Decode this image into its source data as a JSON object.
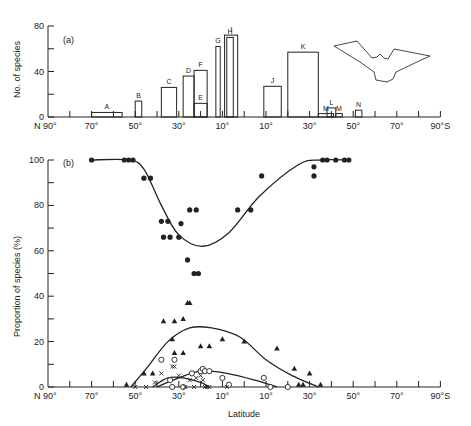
{
  "chart_data": [
    {
      "panel": "(a)",
      "type": "bar",
      "title": "",
      "xlabel": "",
      "ylabel": "No. of species",
      "ylim": [
        0,
        80
      ],
      "yticks": [
        0,
        40,
        80
      ],
      "xticks": [
        "N 90°",
        "70°",
        "50°",
        "30°",
        "10°",
        "10°",
        "30°",
        "50°",
        "70°",
        "90°S"
      ],
      "grid": false,
      "legend": null,
      "annotation": "bat silhouette (upper right)",
      "bars": [
        {
          "label": "A",
          "lat_from": "70°N",
          "lat_to": "56°N",
          "value": 4
        },
        {
          "label": "B",
          "lat_from": "50°N",
          "lat_to": "47°N",
          "value": 14
        },
        {
          "label": "C",
          "lat_from": "38°N",
          "lat_to": "31°N",
          "value": 26
        },
        {
          "label": "D",
          "lat_from": "28°N",
          "lat_to": "23°N",
          "value": 36
        },
        {
          "label": "E",
          "lat_from": "23°N",
          "lat_to": "17°N",
          "value": 12
        },
        {
          "label": "F",
          "lat_from": "23°N",
          "lat_to": "17°N",
          "value": 41
        },
        {
          "label": "G",
          "lat_from": "13°N",
          "lat_to": "11°N",
          "value": 62
        },
        {
          "label": "H",
          "lat_from": "8°N",
          "lat_to": "5°N",
          "value": 70
        },
        {
          "label": "I",
          "lat_from": "9°N",
          "lat_to": "3°N",
          "value": 72
        },
        {
          "label": "J",
          "lat_from": "9°S",
          "lat_to": "17°S",
          "value": 27
        },
        {
          "label": "K",
          "lat_from": "20°S",
          "lat_to": "34°S",
          "value": 57
        },
        {
          "label": "M",
          "lat_from": "34°S",
          "lat_to": "41°S",
          "value": 3
        },
        {
          "label": "L",
          "lat_from": "38°S",
          "lat_to": "42°S",
          "value": 8
        },
        {
          "label": "M",
          "lat_from": "42°S",
          "lat_to": "45°S",
          "value": 3
        },
        {
          "label": "N",
          "lat_from": "51°S",
          "lat_to": "54°S",
          "value": 6
        }
      ]
    },
    {
      "panel": "(b)",
      "type": "scatter",
      "title": "",
      "xlabel": "Latitude",
      "ylabel": "Proportion of species (%)",
      "ylim": [
        0,
        100
      ],
      "yticks": [
        0,
        20,
        40,
        60,
        80,
        100
      ],
      "xticks": [
        "N 90°",
        "70°",
        "50°",
        "30°",
        "10°",
        "10°",
        "30°",
        "50°",
        "70°",
        "90°S"
      ],
      "grid": false,
      "legend": null,
      "x_encoding": "position from N90 (0) to S90 (180); south latitudes = 90 + lat",
      "series": [
        {
          "name": "filled circles",
          "marker": "●",
          "points": [
            [
              20,
              100
            ],
            [
              35,
              100
            ],
            [
              37,
              100
            ],
            [
              39,
              100
            ],
            [
              44,
              92
            ],
            [
              47,
              92
            ],
            [
              52,
              73
            ],
            [
              53,
              66
            ],
            [
              55,
              73
            ],
            [
              56,
              66
            ],
            [
              60,
              66
            ],
            [
              61,
              72
            ],
            [
              64,
              56
            ],
            [
              65,
              78
            ],
            [
              67,
              50
            ],
            [
              68,
              78
            ],
            [
              69,
              50
            ],
            [
              87,
              78
            ],
            [
              93,
              78
            ],
            [
              98,
              93
            ],
            [
              122,
              93
            ],
            [
              122,
              97
            ],
            [
              126,
              100
            ],
            [
              128,
              100
            ],
            [
              132,
              100
            ],
            [
              136,
              100
            ],
            [
              138,
              100
            ]
          ],
          "fit": [
            [
              20,
              100
            ],
            [
              37,
              100
            ],
            [
              44,
              96
            ],
            [
              52,
              80
            ],
            [
              60,
              67
            ],
            [
              71,
              62
            ],
            [
              83,
              68
            ],
            [
              97,
              84
            ],
            [
              115,
              98
            ],
            [
              125,
              100
            ],
            [
              138,
              100
            ]
          ]
        },
        {
          "name": "filled triangles",
          "marker": "▲",
          "points": [
            [
              36,
              1
            ],
            [
              44,
              6
            ],
            [
              48,
              6
            ],
            [
              53,
              29
            ],
            [
              58,
              29
            ],
            [
              57,
              21
            ],
            [
              62,
              30
            ],
            [
              64,
              37
            ],
            [
              65,
              37
            ],
            [
              58,
              15
            ],
            [
              62,
              15
            ],
            [
              70,
              18
            ],
            [
              74,
              18
            ],
            [
              80,
              21
            ],
            [
              90,
              20
            ],
            [
              105,
              17
            ],
            [
              113,
              8
            ],
            [
              115,
              1
            ],
            [
              117,
              1
            ],
            [
              120,
              6
            ],
            [
              125,
              1
            ]
          ],
          "fit": [
            [
              38,
              0
            ],
            [
              45,
              8
            ],
            [
              55,
              20
            ],
            [
              65,
              26
            ],
            [
              75,
              26
            ],
            [
              88,
              22
            ],
            [
              100,
              12
            ],
            [
              112,
              5
            ],
            [
              124,
              0
            ]
          ]
        },
        {
          "name": "open circles",
          "marker": "○",
          "points": [
            [
              52,
              12
            ],
            [
              58,
              12
            ],
            [
              56,
              3
            ],
            [
              57,
              0
            ],
            [
              62,
              0
            ],
            [
              66,
              6
            ],
            [
              70,
              7
            ],
            [
              71,
              8
            ],
            [
              72,
              7
            ],
            [
              74,
              7
            ],
            [
              80,
              4
            ],
            [
              83,
              1
            ],
            [
              99,
              4
            ],
            [
              102,
              0
            ],
            [
              110,
              0
            ]
          ],
          "fit": [
            [
              50,
              0
            ],
            [
              60,
              4
            ],
            [
              70,
              7
            ],
            [
              82,
              6
            ],
            [
              95,
              3
            ],
            [
              105,
              0
            ]
          ]
        },
        {
          "name": "crosses",
          "marker": "x",
          "points": [
            [
              40,
              0
            ],
            [
              45,
              0
            ],
            [
              49,
              2
            ],
            [
              52,
              6
            ],
            [
              57,
              9
            ],
            [
              58,
              9
            ],
            [
              60,
              5
            ],
            [
              63,
              0
            ],
            [
              65,
              3
            ],
            [
              67,
              0
            ],
            [
              68,
              4
            ],
            [
              70,
              5
            ],
            [
              71,
              3
            ],
            [
              72,
              0
            ],
            [
              73,
              0
            ],
            [
              74,
              0
            ],
            [
              82,
              0
            ]
          ],
          "fit": [
            [
              48,
              0
            ],
            [
              55,
              4
            ],
            [
              62,
              4
            ],
            [
              70,
              2
            ],
            [
              74,
              0
            ]
          ]
        }
      ]
    }
  ],
  "figure": {
    "panel_a_label": "(a)",
    "panel_b_label": "(b)",
    "top_ylabel": "No. of species",
    "bottom_ylabel": "Proportion of species (%)",
    "xlabel": "Latitude",
    "top_yticks": [
      "0",
      "40",
      "80"
    ],
    "bottom_yticks": [
      "0",
      "20",
      "40",
      "60",
      "80",
      "100"
    ],
    "xticks": [
      "N 90°",
      "70°",
      "50°",
      "30°",
      "10°",
      "10°",
      "30°",
      "50°",
      "70°",
      "90°S"
    ],
    "ink": "#222222"
  }
}
